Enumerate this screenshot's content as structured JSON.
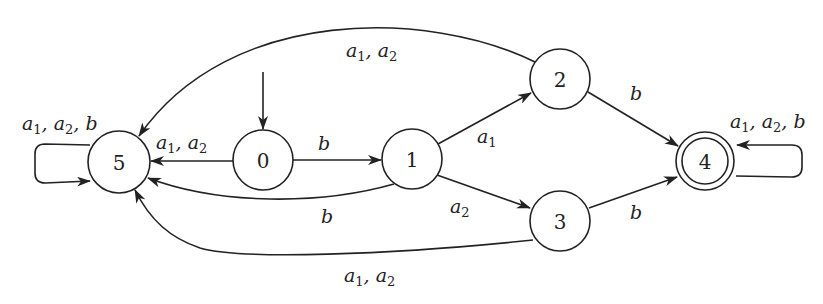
{
  "diagram": {
    "type": "finite-automaton",
    "initial_state": "0",
    "accepting_states": [
      "4"
    ],
    "nodes": [
      {
        "id": "5",
        "label": "5",
        "x": 119,
        "y": 162,
        "r": 31,
        "accepting": false
      },
      {
        "id": "0",
        "label": "0",
        "x": 263,
        "y": 160,
        "r": 30,
        "accepting": false
      },
      {
        "id": "1",
        "label": "1",
        "x": 412,
        "y": 159,
        "r": 30,
        "accepting": false
      },
      {
        "id": "2",
        "label": "2",
        "x": 560,
        "y": 79,
        "r": 30,
        "accepting": false
      },
      {
        "id": "3",
        "label": "3",
        "x": 560,
        "y": 221,
        "r": 30,
        "accepting": false
      },
      {
        "id": "4",
        "label": "4",
        "x": 705,
        "y": 161,
        "r": 29,
        "accepting": true
      }
    ],
    "edges": [
      {
        "from": "0",
        "to": "5",
        "label": "a1, a2"
      },
      {
        "from": "0",
        "to": "1",
        "label": "b"
      },
      {
        "from": "1",
        "to": "2",
        "label": "a1"
      },
      {
        "from": "1",
        "to": "3",
        "label": "a2"
      },
      {
        "from": "1",
        "to": "5",
        "label": "b"
      },
      {
        "from": "2",
        "to": "4",
        "label": "b"
      },
      {
        "from": "3",
        "to": "4",
        "label": "b"
      },
      {
        "from": "2",
        "to": "5",
        "label": "a1, a2"
      },
      {
        "from": "3",
        "to": "5",
        "label": "a1, a2"
      },
      {
        "from": "5",
        "to": "5",
        "label": "a1, a2, b"
      },
      {
        "from": "4",
        "to": "4",
        "label": "a1, a2, b"
      }
    ]
  }
}
